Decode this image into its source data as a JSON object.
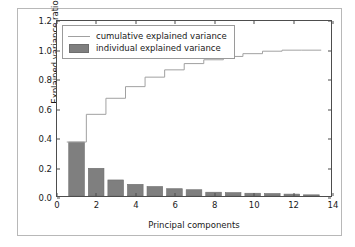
{
  "chart_data": {
    "type": "bar",
    "title": "",
    "xlabel": "Principal components",
    "ylabel": "Explained variance ratio",
    "xlim": [
      0,
      14
    ],
    "ylim": [
      0.0,
      1.2
    ],
    "grid": false,
    "legend_position": "upper left",
    "xticks": [
      "0",
      "2",
      "4",
      "6",
      "8",
      "10",
      "12",
      "14"
    ],
    "xtick_values": [
      0,
      2,
      4,
      6,
      8,
      10,
      12,
      14
    ],
    "yticks": [
      "0.0",
      "0.2",
      "0.4",
      "0.6",
      "0.8",
      "1.0",
      "1.2"
    ],
    "ytick_values": [
      0.0,
      0.2,
      0.4,
      0.6,
      0.8,
      1.0,
      1.2
    ],
    "categories": [
      1,
      2,
      3,
      4,
      5,
      6,
      7,
      8,
      9,
      10,
      11,
      12,
      13
    ],
    "series": [
      {
        "name": "individual explained variance",
        "kind": "bar",
        "color": "#7f7f7f",
        "values": [
          0.37,
          0.19,
          0.11,
          0.08,
          0.065,
          0.05,
          0.043,
          0.026,
          0.023,
          0.019,
          0.017,
          0.013,
          0.008
        ]
      },
      {
        "name": "cumulative explained variance",
        "kind": "step",
        "color": "#a0a0a0",
        "values": [
          0.37,
          0.56,
          0.67,
          0.75,
          0.815,
          0.865,
          0.908,
          0.934,
          0.957,
          0.976,
          0.993,
          1.0,
          1.0
        ]
      }
    ]
  },
  "legend": {
    "items": [
      {
        "label": "cumulative explained variance",
        "key": "line"
      },
      {
        "label": "individual explained variance",
        "key": "swatch"
      }
    ]
  },
  "colors": {
    "bar": "#7f7f7f",
    "line": "#a0a0a0",
    "axis": "#4d4d4d",
    "figure_border": "#b8b8b8",
    "text": "#1a1a1a",
    "background": "#ffffff"
  }
}
